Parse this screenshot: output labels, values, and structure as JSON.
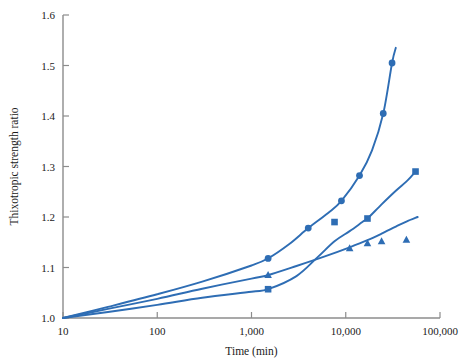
{
  "chart_data": {
    "type": "line",
    "title": "",
    "xlabel": "Time (min)",
    "ylabel": "Thixotropic strength ratio",
    "xscale": "log",
    "yscale": "linear",
    "xlim": [
      10,
      100000
    ],
    "ylim": [
      1.0,
      1.6
    ],
    "grid": false,
    "legend": "none",
    "xticks": [
      10,
      100,
      1000,
      10000,
      100000
    ],
    "xtick_labels": [
      "10",
      "100",
      "1,000",
      "10,000",
      "100,000"
    ],
    "yticks": [
      1.0,
      1.1,
      1.2,
      1.3,
      1.4,
      1.5,
      1.6
    ],
    "ytick_labels": [
      "1.0",
      "1.1",
      "1.2",
      "1.3",
      "1.4",
      "1.5",
      "1.6"
    ],
    "series": [
      {
        "name": "series-circle",
        "marker": "circle",
        "color": "#2E6DB4",
        "x": [
          10,
          1500,
          4000,
          9000,
          14000,
          25000,
          31000
        ],
        "y": [
          1.0,
          1.118,
          1.178,
          1.232,
          1.282,
          1.405,
          1.505
        ],
        "line_x": [
          10,
          30,
          100,
          300,
          1000,
          1500,
          2500,
          4000,
          6500,
          9000,
          14000,
          19000,
          25000,
          31000,
          34000
        ],
        "line_y": [
          1.0,
          1.022,
          1.047,
          1.072,
          1.104,
          1.118,
          1.146,
          1.178,
          1.208,
          1.232,
          1.282,
          1.332,
          1.405,
          1.505,
          1.535
        ]
      },
      {
        "name": "series-square",
        "marker": "square",
        "color": "#2E6DB4",
        "x": [
          10,
          1500,
          7600,
          17000,
          55000
        ],
        "y": [
          1.0,
          1.057,
          1.19,
          1.197,
          1.29
        ],
        "line_x": [
          10,
          30,
          100,
          300,
          1000,
          1500,
          3000,
          5000,
          7600,
          11000,
          15000,
          17000,
          24000,
          34000,
          45000,
          55000
        ],
        "line_y": [
          1.0,
          1.012,
          1.026,
          1.04,
          1.052,
          1.057,
          1.083,
          1.12,
          1.152,
          1.172,
          1.19,
          1.197,
          1.225,
          1.252,
          1.272,
          1.29
        ]
      },
      {
        "name": "series-triangle",
        "marker": "triangle",
        "color": "#2E6DB4",
        "x": [
          10,
          1500,
          11000,
          17000,
          24000,
          44000
        ],
        "y": [
          1.0,
          1.085,
          1.138,
          1.148,
          1.152,
          1.155
        ],
        "line_x": [
          10,
          30,
          100,
          300,
          1000,
          1500,
          3000,
          6000,
          11000,
          17000,
          24000,
          34000,
          44000,
          58000
        ],
        "line_y": [
          1.0,
          1.018,
          1.038,
          1.058,
          1.078,
          1.085,
          1.103,
          1.122,
          1.14,
          1.154,
          1.167,
          1.181,
          1.191,
          1.2
        ]
      }
    ]
  },
  "axes": {
    "x_title": "Time (min)",
    "y_title": "Thixotropic strength ratio"
  },
  "style": {
    "line_color": "#2E6DB4",
    "axis_color": "#8c8c8c",
    "text_color": "#1a1a1a",
    "background": "#ffffff"
  }
}
